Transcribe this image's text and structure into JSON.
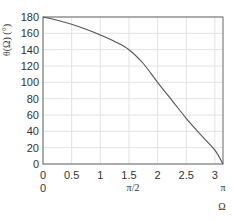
{
  "chart_data": {
    "type": "line",
    "title": "",
    "xlabel": "Ω",
    "ylabel": "θ(Ω) (°)",
    "xlim": [
      0,
      3.1416
    ],
    "ylim": [
      0,
      180
    ],
    "grid": true,
    "x_ticks": [
      "0",
      "0.5",
      "1",
      "1.5",
      "2",
      "2.5",
      "3"
    ],
    "x_ticks_secondary": [
      "0",
      "π/2",
      "π"
    ],
    "y_ticks": [
      "0",
      "20",
      "40",
      "60",
      "80",
      "100",
      "120",
      "140",
      "160",
      "180"
    ],
    "series": [
      {
        "name": "θ(Ω)",
        "x": [
          0,
          0.25,
          0.5,
          0.75,
          1.0,
          1.25,
          1.5,
          1.75,
          2.0,
          2.25,
          2.5,
          2.75,
          3.0,
          3.1416
        ],
        "values": [
          180,
          176,
          171,
          165,
          158,
          150,
          140,
          123,
          100,
          78,
          56,
          36,
          17,
          0
        ]
      }
    ]
  },
  "axes": {
    "ylabel": "θ(Ω) (°)",
    "xlabel": "Ω",
    "xsec_0": "0",
    "xsec_pi2": "π/2",
    "xsec_pi": "π"
  }
}
